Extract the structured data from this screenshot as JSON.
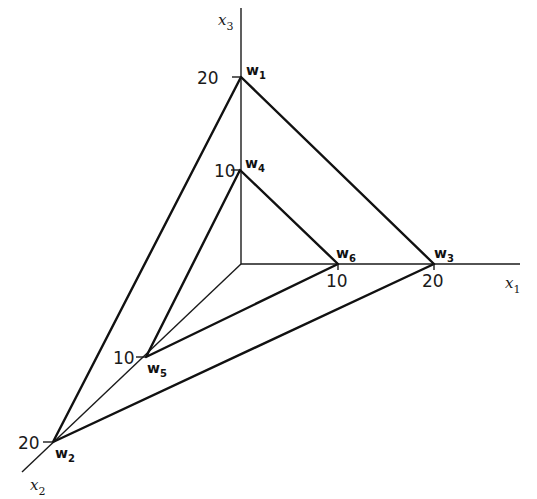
{
  "diagram": {
    "axes": [
      {
        "id": "x1",
        "label": "x",
        "sub": "1",
        "from": [
          241,
          264
        ],
        "to": [
          520,
          264
        ],
        "label_pos": [
          505,
          288
        ]
      },
      {
        "id": "x2",
        "label": "x",
        "sub": "2",
        "from": [
          241,
          264
        ],
        "to": [
          22,
          472
        ],
        "label_pos": [
          30,
          490
        ]
      },
      {
        "id": "x3",
        "label": "x",
        "sub": "3",
        "from": [
          241,
          264
        ],
        "to": [
          241,
          8
        ],
        "label_pos": [
          218,
          25
        ]
      }
    ],
    "ticks": [
      {
        "id": "x3-20",
        "value": "20",
        "at": [
          241,
          77
        ],
        "label_pos": [
          197,
          84
        ],
        "tick": [
          [
            232,
            77
          ],
          [
            241,
            77
          ]
        ]
      },
      {
        "id": "x3-10",
        "value": "10",
        "at": [
          240,
          170
        ],
        "label_pos": [
          214,
          177
        ],
        "tick": [
          [
            231,
            170
          ],
          [
            240,
            170
          ]
        ]
      },
      {
        "id": "x1-10",
        "value": "10",
        "at": [
          338,
          264
        ],
        "label_pos": [
          326,
          287
        ],
        "tick": [
          [
            338,
            264
          ],
          [
            338,
            270
          ]
        ]
      },
      {
        "id": "x1-20",
        "value": "20",
        "at": [
          434,
          264
        ],
        "label_pos": [
          422,
          287
        ],
        "tick": [
          [
            434,
            264
          ],
          [
            434,
            270
          ]
        ]
      },
      {
        "id": "x2-10",
        "value": "10",
        "at": [
          146,
          357
        ],
        "label_pos": [
          113,
          364
        ],
        "tick": [
          [
            136,
            357
          ],
          [
            146,
            357
          ]
        ]
      },
      {
        "id": "x2-20",
        "value": "20",
        "at": [
          53,
          442
        ],
        "label_pos": [
          18,
          449
        ],
        "tick": [
          [
            43,
            442
          ],
          [
            53,
            442
          ]
        ]
      }
    ],
    "points": [
      {
        "id": "W1",
        "label": "W",
        "sub": "1",
        "at": [
          241,
          77
        ],
        "label_pos": [
          246,
          75
        ]
      },
      {
        "id": "W2",
        "label": "W",
        "sub": "2",
        "at": [
          53,
          442
        ],
        "label_pos": [
          55,
          458
        ]
      },
      {
        "id": "W3",
        "label": "W",
        "sub": "3",
        "at": [
          434,
          264
        ],
        "label_pos": [
          434,
          258
        ]
      },
      {
        "id": "W4",
        "label": "W",
        "sub": "4",
        "at": [
          240,
          170
        ],
        "label_pos": [
          245,
          168
        ]
      },
      {
        "id": "W5",
        "label": "W",
        "sub": "5",
        "at": [
          146,
          357
        ],
        "label_pos": [
          147,
          373
        ]
      },
      {
        "id": "W6",
        "label": "W",
        "sub": "6",
        "at": [
          338,
          264
        ],
        "label_pos": [
          336,
          258
        ]
      }
    ],
    "triangles": [
      {
        "id": "outer",
        "vertices": [
          "W1",
          "W3",
          "W2"
        ]
      },
      {
        "id": "inner",
        "vertices": [
          "W4",
          "W6",
          "W5"
        ]
      }
    ]
  }
}
